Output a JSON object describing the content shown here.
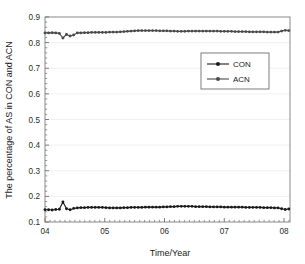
{
  "chart_data": {
    "type": "line",
    "title": "",
    "xlabel": "Time/Year",
    "ylabel": "The percentage of AS in CON and ACN",
    "xlim": [
      4.0,
      8.1
    ],
    "ylim": [
      0.1,
      0.9
    ],
    "xticks": [
      "04",
      "05",
      "06",
      "07",
      "08"
    ],
    "xtick_values": [
      4,
      5,
      6,
      7,
      8
    ],
    "yticks": [
      "0.1",
      "0.2",
      "0.3",
      "0.4",
      "0.5",
      "0.6",
      "0.7",
      "0.8",
      "0.9"
    ],
    "ytick_values": [
      0.1,
      0.2,
      0.3,
      0.4,
      0.5,
      0.6,
      0.7,
      0.8,
      0.9
    ],
    "grid": "horizontal-major-faint",
    "legend_position": "upper-right-inside",
    "x": [
      4.0,
      4.06,
      4.12,
      4.18,
      4.24,
      4.3,
      4.36,
      4.42,
      4.48,
      4.54,
      4.6,
      4.66,
      4.72,
      4.78,
      4.84,
      4.9,
      4.96,
      5.02,
      5.08,
      5.14,
      5.2,
      5.26,
      5.32,
      5.38,
      5.44,
      5.5,
      5.56,
      5.62,
      5.68,
      5.74,
      5.8,
      5.86,
      5.92,
      5.98,
      6.04,
      6.1,
      6.16,
      6.22,
      6.28,
      6.34,
      6.4,
      6.46,
      6.52,
      6.58,
      6.64,
      6.7,
      6.76,
      6.82,
      6.88,
      6.94,
      7.0,
      7.06,
      7.12,
      7.18,
      7.24,
      7.3,
      7.36,
      7.42,
      7.48,
      7.54,
      7.6,
      7.66,
      7.72,
      7.78,
      7.84,
      7.9,
      7.96,
      8.02,
      8.08
    ],
    "series": [
      {
        "name": "CON",
        "marker": "filled-circle",
        "color": "#1a1a1a",
        "values": [
          0.148,
          0.148,
          0.147,
          0.149,
          0.15,
          0.178,
          0.152,
          0.148,
          0.153,
          0.155,
          0.156,
          0.156,
          0.157,
          0.157,
          0.157,
          0.157,
          0.157,
          0.156,
          0.155,
          0.155,
          0.155,
          0.155,
          0.156,
          0.156,
          0.157,
          0.157,
          0.157,
          0.157,
          0.158,
          0.158,
          0.158,
          0.158,
          0.158,
          0.159,
          0.159,
          0.16,
          0.16,
          0.161,
          0.161,
          0.161,
          0.161,
          0.161,
          0.16,
          0.16,
          0.16,
          0.16,
          0.159,
          0.159,
          0.159,
          0.159,
          0.158,
          0.158,
          0.158,
          0.158,
          0.158,
          0.158,
          0.157,
          0.157,
          0.157,
          0.157,
          0.157,
          0.156,
          0.156,
          0.156,
          0.155,
          0.155,
          0.152,
          0.149,
          0.151
        ]
      },
      {
        "name": "ACN",
        "marker": "filled-circle",
        "color": "#4a4a4a",
        "values": [
          0.838,
          0.838,
          0.839,
          0.838,
          0.836,
          0.818,
          0.832,
          0.826,
          0.83,
          0.838,
          0.838,
          0.839,
          0.839,
          0.84,
          0.84,
          0.84,
          0.84,
          0.84,
          0.841,
          0.841,
          0.841,
          0.842,
          0.843,
          0.844,
          0.845,
          0.846,
          0.847,
          0.847,
          0.847,
          0.847,
          0.847,
          0.847,
          0.846,
          0.846,
          0.846,
          0.845,
          0.845,
          0.844,
          0.844,
          0.844,
          0.845,
          0.845,
          0.845,
          0.845,
          0.845,
          0.845,
          0.845,
          0.845,
          0.845,
          0.844,
          0.844,
          0.844,
          0.844,
          0.843,
          0.843,
          0.843,
          0.843,
          0.842,
          0.842,
          0.842,
          0.842,
          0.842,
          0.841,
          0.841,
          0.841,
          0.841,
          0.845,
          0.848,
          0.847
        ]
      }
    ]
  },
  "legend": {
    "items": [
      {
        "label": "CON"
      },
      {
        "label": "ACN"
      }
    ]
  }
}
